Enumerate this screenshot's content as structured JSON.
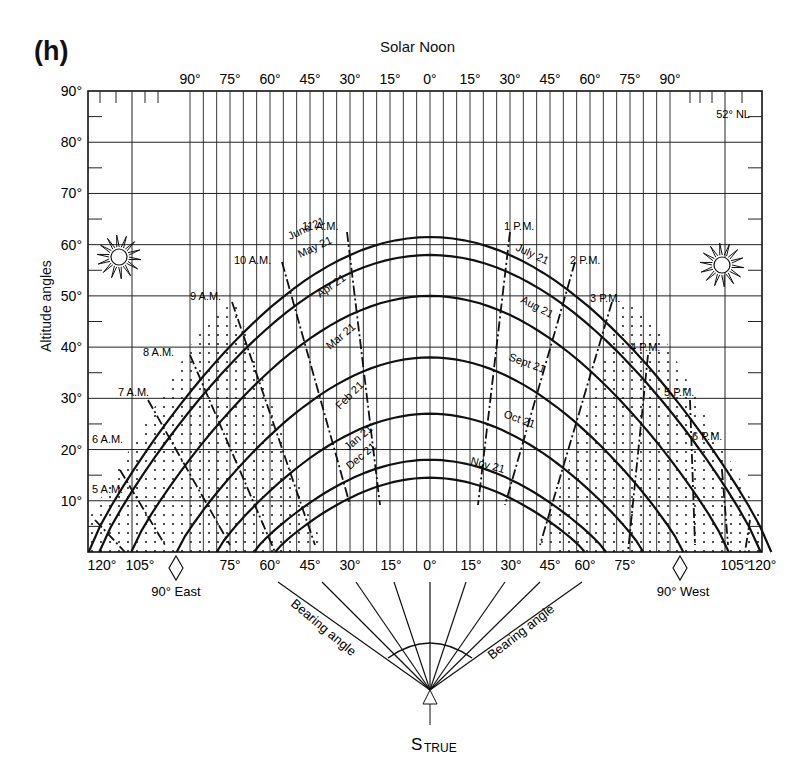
{
  "panel_label": "(h)",
  "chart_data": {
    "type": "line",
    "title": "Solar Noon",
    "subtitle": "52° NL",
    "xlabel": "Bearing angle",
    "ylabel": "Altitude angles",
    "ylim": [
      0,
      90
    ],
    "yticks": [
      "10°",
      "20°",
      "30°",
      "40°",
      "50°",
      "60°",
      "70°",
      "80°",
      "90°"
    ],
    "top_xticks": [
      "90°",
      "75°",
      "60°",
      "45°",
      "30°",
      "15°",
      "0°",
      "15°",
      "30°",
      "45°",
      "60°",
      "75°",
      "90°"
    ],
    "bottom_xticks": [
      "120°",
      "105°",
      "75°",
      "60°",
      "45°",
      "30°",
      "15°",
      "0°",
      "15°",
      "30°",
      "45°",
      "60°",
      "75°",
      "105°",
      "120°"
    ],
    "direction_markers": [
      "90° East",
      "90° West"
    ],
    "observer_label": "S",
    "observer_subscript": "TRUE",
    "bearing_labels": [
      "Bearing angle",
      "Bearing angle"
    ],
    "grid": true,
    "date_series": [
      {
        "name": "June 21",
        "noon_altitude": 61.5
      },
      {
        "name": "May 21",
        "noon_altitude": 58
      },
      {
        "name": "July 21",
        "noon_altitude": 58
      },
      {
        "name": "Apr 21",
        "noon_altitude": 50
      },
      {
        "name": "Aug 21",
        "noon_altitude": 50
      },
      {
        "name": "Mar 21",
        "noon_altitude": 38
      },
      {
        "name": "Sept 21",
        "noon_altitude": 38
      },
      {
        "name": "Feb 21",
        "noon_altitude": 27
      },
      {
        "name": "Oct 21",
        "noon_altitude": 27
      },
      {
        "name": "Jan 21",
        "noon_altitude": 18
      },
      {
        "name": "Nov 21",
        "noon_altitude": 18
      },
      {
        "name": "Dec 21",
        "noon_altitude": 14.5
      }
    ],
    "hour_lines": [
      "5 A.M.",
      "6 A.M.",
      "7 A.M.",
      "8 A.M.",
      "9 A.M.",
      "10 A.M.",
      "11 A.M.",
      "1 P.M.",
      "2 P.M.",
      "3 P.M.",
      "4 P.M.",
      "5 P.M.",
      "6 P.M."
    ],
    "month_labels": [
      "June 21",
      "May 21",
      "Apr 21",
      "Mar 21",
      "Feb 21",
      "Jan 21",
      "Dec 21",
      "July 21",
      "Aug 21",
      "Sept 21",
      "Oct 21",
      "Nov 21"
    ]
  }
}
